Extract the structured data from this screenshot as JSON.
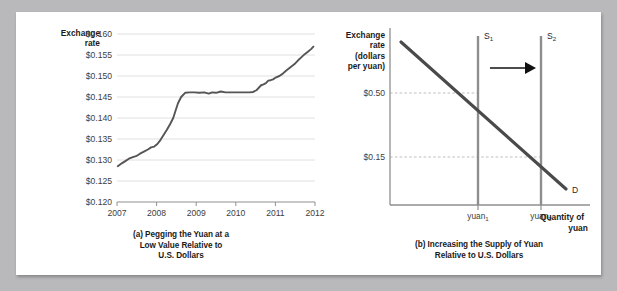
{
  "figure": {
    "panel_a": {
      "caption_lines": [
        "(a) Pegging the Yuan at a",
        "Low Value Relative to",
        "U.S. Dollars"
      ],
      "y_axis_label_lines": [
        "Exchange",
        "rate"
      ]
    },
    "panel_b": {
      "caption_lines": [
        "(b) Increasing the Supply of Yuan",
        "Relative to U.S. Dollars"
      ],
      "y_axis_label_lines": [
        "Exchange",
        "rate",
        "(dollars",
        "per yuan)"
      ],
      "x_axis_label_lines": [
        "Quantity of",
        "yuan"
      ],
      "y_ticks": [
        "$0.50",
        "$0.15"
      ],
      "x_ticks": [
        {
          "base": "yuan",
          "sub": "1"
        },
        {
          "base": "yuan",
          "sub": "2"
        }
      ],
      "curves": [
        {
          "base": "S",
          "sub": "1",
          "name": "supply-1"
        },
        {
          "base": "S",
          "sub": "2",
          "name": "supply-2"
        },
        {
          "base": "D",
          "sub": "",
          "name": "demand"
        }
      ],
      "shift_arrow": "rightward-shift-arrow"
    }
  },
  "colors": {
    "page_background": "#b9b9bb",
    "panel_background": "#ffffff",
    "line_dark": "#555555",
    "supply_gray": "#8e8e8e",
    "demand_dark": "#4a4a4a",
    "gridline": "#d8d8d8",
    "axis": "#909090",
    "dashed": "#bfbfbf",
    "arrow": "#111111"
  },
  "chart_data": [
    {
      "type": "line",
      "id": "panel-a-exchange-rate",
      "title": "(a) Pegging the Yuan at a Low Value Relative to U.S. Dollars",
      "xlabel": "",
      "ylabel": "Exchange rate",
      "xlim": [
        2007,
        2012
      ],
      "ylim": [
        0.12,
        0.16
      ],
      "ytick_step": 0.005,
      "yticks": [
        "$0.120",
        "$0.125",
        "$0.130",
        "$0.135",
        "$0.140",
        "$0.145",
        "$0.150",
        "$0.155",
        "$0.160"
      ],
      "ytick_values": [
        0.12,
        0.125,
        0.13,
        0.135,
        0.14,
        0.145,
        0.15,
        0.155,
        0.16
      ],
      "xticks": [
        "2007",
        "2008",
        "2009",
        "2010",
        "2011",
        "2012"
      ],
      "xtick_values": [
        2007,
        2008,
        2009,
        2010,
        2011,
        2012
      ],
      "grid": true,
      "legend": "none",
      "series": [
        {
          "name": "Yuan-dollar exchange rate",
          "x": [
            2007.02,
            2007.12,
            2007.22,
            2007.3,
            2007.4,
            2007.5,
            2007.58,
            2007.68,
            2007.78,
            2007.86,
            2007.94,
            2008.02,
            2008.1,
            2008.18,
            2008.26,
            2008.34,
            2008.42,
            2008.48,
            2008.54,
            2008.62,
            2008.72,
            2008.84,
            2008.96,
            2009.08,
            2009.2,
            2009.32,
            2009.4,
            2009.5,
            2009.62,
            2009.74,
            2009.86,
            2009.98,
            2010.1,
            2010.22,
            2010.34,
            2010.44,
            2010.52,
            2010.58,
            2010.64,
            2010.7,
            2010.76,
            2010.82,
            2010.88,
            2010.94,
            2011.02,
            2011.1,
            2011.18,
            2011.26,
            2011.34,
            2011.42,
            2011.5,
            2011.58,
            2011.66,
            2011.74,
            2011.82,
            2011.9,
            2011.96
          ],
          "y": [
            0.1285,
            0.1292,
            0.1298,
            0.1303,
            0.1307,
            0.131,
            0.1315,
            0.132,
            0.1325,
            0.133,
            0.1332,
            0.1338,
            0.1348,
            0.136,
            0.1372,
            0.1385,
            0.14,
            0.1418,
            0.1435,
            0.145,
            0.146,
            0.1461,
            0.1461,
            0.146,
            0.1461,
            0.1458,
            0.1461,
            0.146,
            0.1463,
            0.1461,
            0.1461,
            0.1461,
            0.1461,
            0.1461,
            0.1461,
            0.1462,
            0.1466,
            0.1472,
            0.1478,
            0.148,
            0.1483,
            0.1489,
            0.149,
            0.1492,
            0.1497,
            0.15,
            0.1505,
            0.1512,
            0.1518,
            0.1524,
            0.153,
            0.1538,
            0.1545,
            0.1552,
            0.1558,
            0.1564,
            0.157
          ]
        }
      ]
    },
    {
      "type": "line",
      "id": "panel-b-supply-demand",
      "title": "(b) Increasing the Supply of Yuan Relative to U.S. Dollars",
      "xlabel": "Quantity of yuan",
      "ylabel": "Exchange rate (dollars per yuan)",
      "grid": false,
      "legend": "inline-labels",
      "yticks": [
        "$0.50",
        "$0.15"
      ],
      "ytick_values": [
        0.5,
        0.15
      ],
      "xticks": [
        "yuan1",
        "yuan2"
      ],
      "series": [
        {
          "name": "S1",
          "type": "vertical-line",
          "x": 0.33,
          "y_from": 0.92,
          "y_to": 0.0
        },
        {
          "name": "S2",
          "type": "vertical-line",
          "x": 0.64,
          "y_from": 0.92,
          "y_to": 0.0
        },
        {
          "name": "D",
          "type": "downward-sloping",
          "x_from": 0.08,
          "y_from": 0.9,
          "x_to": 0.88,
          "y_to": 0.12
        }
      ],
      "equilibria": [
        {
          "label": "$0.50",
          "quantity": "yuan1"
        },
        {
          "label": "$0.15",
          "quantity": "yuan2"
        }
      ],
      "annotations": [
        {
          "name": "supply-shift-arrow",
          "direction": "right"
        }
      ]
    }
  ]
}
